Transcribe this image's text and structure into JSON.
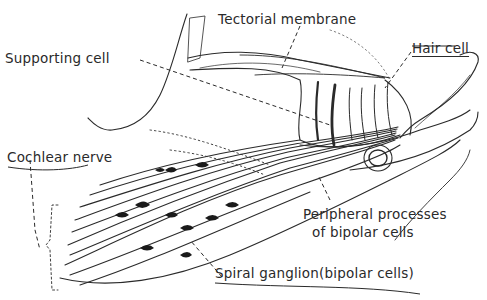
{
  "diagram": {
    "style": "pen-and-ink hand-drawn illustration",
    "colors": {
      "ink": "#2a2a2a",
      "background": "#ffffff"
    },
    "labels": {
      "tectorial_membrane": "Tectorial membrane",
      "hair_cell": "Hair cell",
      "supporting_cell": "Supporting cell",
      "cochlear_nerve": "Cochlear nerve",
      "peripheral_line1": "Peripheral processes",
      "peripheral_line2": "of bipolar cells",
      "spiral_ganglion": "Spiral ganglion",
      "spiral_ganglion_paren": "(bipolar cells)"
    }
  }
}
